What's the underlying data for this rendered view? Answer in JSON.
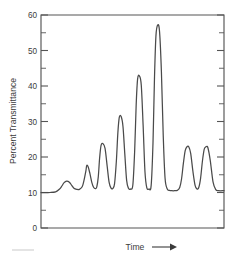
{
  "chart_data": {
    "type": "line",
    "title": "",
    "xlabel": "Time",
    "ylabel": "Percent Transmittance",
    "xlabel_suffix_icon": "right-arrow",
    "ylim": [
      0,
      60
    ],
    "y_major_ticks": [
      0,
      10,
      20,
      30,
      40,
      50,
      60
    ],
    "y_minor_ticks": [
      5,
      15,
      25,
      35,
      45,
      55
    ],
    "y_tick_labels": [
      "0",
      "10",
      "20",
      "30",
      "40",
      "50",
      "60"
    ],
    "x_ticks": [],
    "x_tick_labels": [],
    "grid": false,
    "legend": null,
    "baseline": 10,
    "peaks": [
      {
        "index": 1,
        "time": 0.14,
        "height": 13.2,
        "label": ""
      },
      {
        "index": 2,
        "time": 0.25,
        "height": 17.6,
        "label": ""
      },
      {
        "index": 3,
        "time": 0.32,
        "height": 23.8,
        "label": ""
      },
      {
        "index": 4,
        "time": 0.42,
        "height": 31.4,
        "label": ""
      },
      {
        "index": 5,
        "time": 0.52,
        "height": 42.8,
        "label": ""
      },
      {
        "index": 6,
        "time": 0.62,
        "height": 57.2,
        "label": ""
      },
      {
        "index": 7,
        "time": 0.78,
        "height": 22.9,
        "label": ""
      },
      {
        "index": 8,
        "time": 0.87,
        "height": 22.9,
        "label": ""
      }
    ],
    "series": [
      {
        "name": "transmittance-trace",
        "color": "#4a4a4a",
        "x": [
          0.0,
          0.02,
          0.05,
          0.08,
          0.1,
          0.115,
          0.125,
          0.14,
          0.155,
          0.168,
          0.18,
          0.195,
          0.21,
          0.225,
          0.235,
          0.245,
          0.25,
          0.258,
          0.268,
          0.278,
          0.288,
          0.298,
          0.305,
          0.313,
          0.32,
          0.328,
          0.338,
          0.35,
          0.362,
          0.372,
          0.382,
          0.392,
          0.402,
          0.412,
          0.42,
          0.428,
          0.438,
          0.448,
          0.458,
          0.468,
          0.478,
          0.49,
          0.502,
          0.512,
          0.52,
          0.528,
          0.538,
          0.548,
          0.558,
          0.568,
          0.578,
          0.59,
          0.602,
          0.612,
          0.62,
          0.628,
          0.638,
          0.648,
          0.658,
          0.668,
          0.678,
          0.69,
          0.702,
          0.715,
          0.73,
          0.745,
          0.758,
          0.768,
          0.778,
          0.788,
          0.798,
          0.808,
          0.818,
          0.83,
          0.842,
          0.852,
          0.862,
          0.872,
          0.882,
          0.892,
          0.902,
          0.912,
          0.925,
          0.94,
          0.955,
          0.97,
          1.0
        ],
        "y": [
          10.0,
          10.0,
          10.0,
          10.2,
          10.9,
          11.9,
          12.7,
          13.2,
          12.9,
          12.0,
          11.2,
          10.9,
          10.9,
          11.6,
          13.4,
          16.0,
          17.6,
          17.2,
          15.2,
          12.8,
          11.4,
          11.1,
          11.6,
          14.4,
          19.5,
          23.2,
          23.8,
          22.4,
          17.2,
          12.9,
          11.3,
          11.1,
          12.5,
          19.0,
          26.8,
          31.2,
          31.4,
          28.6,
          20.8,
          13.4,
          11.2,
          11.0,
          12.2,
          22.0,
          34.6,
          42.0,
          42.8,
          40.2,
          29.0,
          16.0,
          11.4,
          11.0,
          12.0,
          24.0,
          42.0,
          54.0,
          57.2,
          55.2,
          44.0,
          26.0,
          14.0,
          11.0,
          10.6,
          10.5,
          10.5,
          10.6,
          11.4,
          13.8,
          18.2,
          21.8,
          22.9,
          22.8,
          21.0,
          16.0,
          12.0,
          11.0,
          11.4,
          14.0,
          18.8,
          22.2,
          22.9,
          22.6,
          19.0,
          13.0,
          10.8,
          10.5,
          10.5
        ]
      }
    ]
  },
  "figure": {
    "y_axis_label": "Percent Transmittance",
    "x_axis_label": "Time"
  }
}
